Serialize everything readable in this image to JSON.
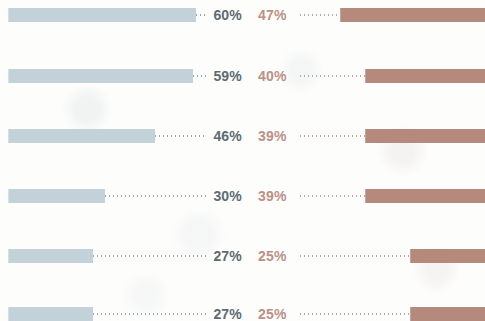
{
  "chart": {
    "type": "bar",
    "title": "",
    "orientation": "horizontal",
    "layout": "back-to-back",
    "grid": false,
    "legend": false,
    "axis_labels_visible": false,
    "category_labels_visible": false,
    "value_suffix": "%"
  },
  "series": {
    "left": {
      "name": "left-series",
      "color": "#c3d2d8",
      "label_color": "#5d6b72",
      "leader_color": "#9aa8ae",
      "anchor": "left"
    },
    "right": {
      "name": "right-series",
      "color": "#b58a7c",
      "label_color": "#bb9186",
      "leader_color": "#c0a69c",
      "anchor": "right"
    }
  },
  "chart_data": {
    "type": "bar",
    "title": "",
    "xlabel": "",
    "ylabel": "",
    "categories": [
      "row-1",
      "row-2",
      "row-3",
      "row-4",
      "row-5",
      "row-6"
    ],
    "series": [
      {
        "name": "left-series",
        "values": [
          60,
          59,
          46,
          30,
          27,
          27
        ]
      },
      {
        "name": "right-series",
        "values": [
          47,
          40,
          39,
          39,
          25,
          25
        ]
      }
    ],
    "value_labels": {
      "left": [
        "60%",
        "59%",
        "46%",
        "30%",
        "27%",
        "27%"
      ],
      "right": [
        "47%",
        "40%",
        "39%",
        "39%",
        "25%",
        "25%"
      ]
    },
    "xlim": [
      0,
      60
    ],
    "grid": false,
    "legend": null
  },
  "rows": [
    {
      "top": 8,
      "left_value": "60%",
      "left_pct": 60,
      "left_bar_width": 188,
      "left_leader_left": 196,
      "left_leader_width": 10,
      "right_value": "47%",
      "right_pct": 47,
      "right_bar_width": 145,
      "right_leader_left": 300,
      "right_leader_width": 40
    },
    {
      "top": 69,
      "left_value": "59%",
      "left_pct": 59,
      "left_bar_width": 185,
      "left_leader_left": 193,
      "left_leader_width": 13,
      "right_value": "40%",
      "right_pct": 40,
      "right_bar_width": 120,
      "right_leader_left": 300,
      "right_leader_width": 65
    },
    {
      "top": 129,
      "left_value": "46%",
      "left_pct": 46,
      "left_bar_width": 147,
      "left_leader_left": 155,
      "left_leader_width": 51,
      "right_value": "39%",
      "right_pct": 39,
      "right_bar_width": 120,
      "right_leader_left": 300,
      "right_leader_width": 65
    },
    {
      "top": 189,
      "left_value": "30%",
      "left_pct": 30,
      "left_bar_width": 97,
      "left_leader_left": 105,
      "left_leader_width": 101,
      "right_value": "39%",
      "right_pct": 39,
      "right_bar_width": 120,
      "right_leader_left": 300,
      "right_leader_width": 65
    },
    {
      "top": 249,
      "left_value": "27%",
      "left_pct": 27,
      "left_bar_width": 85,
      "left_leader_left": 93,
      "left_leader_width": 113,
      "right_value": "25%",
      "right_pct": 25,
      "right_bar_width": 75,
      "right_leader_left": 300,
      "right_leader_width": 110
    },
    {
      "top": 307,
      "left_value": "27%",
      "left_pct": 27,
      "left_bar_width": 85,
      "left_leader_left": 93,
      "left_leader_width": 113,
      "right_value": "25%",
      "right_pct": 25,
      "right_bar_width": 75,
      "right_leader_left": 300,
      "right_leader_width": 110
    }
  ]
}
